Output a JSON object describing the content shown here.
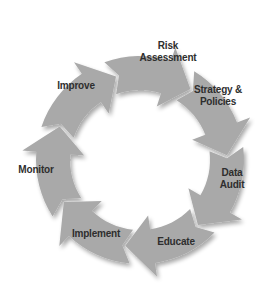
{
  "diagram": {
    "type": "cycle",
    "direction": "clockwise",
    "colors": {
      "arrow_fill": "#a9a9a9",
      "arrow_shadow": "#8c8c8c",
      "text": "#2e2e2e",
      "background": "#ffffff"
    },
    "steps": [
      {
        "label": "Risk Assessment",
        "lines": [
          "Risk",
          "Assessment"
        ]
      },
      {
        "label": "Strategy & Policies",
        "lines": [
          "Strategy &",
          "Policies"
        ]
      },
      {
        "label": "Data Audit",
        "lines": [
          "Data",
          "Audit"
        ]
      },
      {
        "label": "Educate",
        "lines": [
          "Educate"
        ]
      },
      {
        "label": "Implement",
        "lines": [
          "Implement"
        ]
      },
      {
        "label": "Monitor",
        "lines": [
          "Monitor"
        ]
      },
      {
        "label": "Improve",
        "lines": [
          "Improve"
        ]
      }
    ]
  }
}
